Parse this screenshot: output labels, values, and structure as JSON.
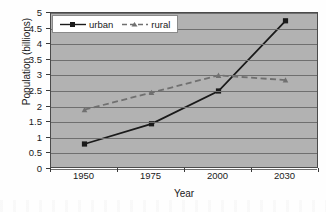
{
  "chart_data": {
    "type": "line",
    "title": "",
    "xlabel": "Year",
    "ylabel": "Population (billions)",
    "categories": [
      "1950",
      "1975",
      "2000",
      "2030"
    ],
    "series": [
      {
        "name": "urban",
        "values": [
          0.8,
          1.45,
          2.5,
          4.75
        ],
        "color": "#1a1a1a",
        "line_style": "solid",
        "marker": "square"
      },
      {
        "name": "rural",
        "values": [
          1.9,
          2.45,
          3.0,
          2.85
        ],
        "color": "#707070",
        "line_style": "dashed",
        "marker": "triangle"
      }
    ],
    "ylim": [
      0,
      5
    ],
    "ytick_step": 0.5,
    "ytick_labels": [
      "0",
      "0.5",
      "1",
      "1.5",
      "2",
      "2.5",
      "3",
      "3.5",
      "4",
      "4.5",
      "5"
    ],
    "grid": "horizontal",
    "legend_position": "top-left-inside",
    "plot_background": "#b2b2b2"
  },
  "legend": {
    "entries": [
      {
        "label": "urban"
      },
      {
        "label": "rural"
      }
    ]
  },
  "axes": {
    "x_title": "Year",
    "y_title": "Population (billions)"
  }
}
